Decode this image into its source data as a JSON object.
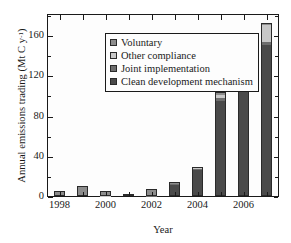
{
  "chart_data": {
    "type": "bar",
    "subtype": "stacked-bar",
    "title": "",
    "xlabel": "Year",
    "ylabel": "Annual emissions trading (Mt C y⁻¹)",
    "ylabel_parts": {
      "text": "Annual emissions trading (Mt C y",
      "sup": "-1",
      "tail": ")"
    },
    "ylim": [
      0,
      180
    ],
    "yticks": [
      0,
      40,
      80,
      120,
      160
    ],
    "ytick_labels": [
      "0",
      "40",
      "80",
      "120",
      "160"
    ],
    "yminor_ticks": [
      20,
      60,
      100,
      140,
      180
    ],
    "grid": false,
    "legend_position": "upper left",
    "categories": [
      "1998",
      "1999",
      "2000",
      "2001",
      "2002",
      "2003",
      "2004",
      "2005",
      "2006",
      "2007"
    ],
    "xtick_labels": [
      "1998",
      "2000",
      "2002",
      "2004",
      "2006"
    ],
    "xtick_label_categories": [
      "1998",
      "2000",
      "2002",
      "2004",
      "2006"
    ],
    "series": [
      {
        "name": "Clean development mechanism",
        "color": "#4a4a4a",
        "values": [
          0.0,
          0.0,
          0.0,
          0.0,
          0.0,
          10.5,
          25.5,
          94.0,
          148.0,
          150.0
        ]
      },
      {
        "name": "Joint implementation",
        "color": "#6e6e6e",
        "values": [
          0.0,
          0.0,
          0.0,
          0.0,
          0.5,
          1.0,
          1.5,
          3.0,
          4.0,
          3.0
        ]
      },
      {
        "name": "Other compliance",
        "color": "#c8c8c8",
        "values": [
          0.0,
          0.0,
          0.5,
          0.0,
          0.5,
          0.5,
          0.5,
          3.0,
          5.0,
          17.0
        ]
      },
      {
        "name": "Voluntary",
        "color": "#8c8c8c",
        "values": [
          4.5,
          9.5,
          4.0,
          2.5,
          5.5,
          2.0,
          1.5,
          3.0,
          3.0,
          2.0
        ]
      }
    ],
    "totals": [
      4.5,
      9.5,
      4.5,
      2.5,
      6.5,
      14.0,
      29.0,
      103.0,
      160.0,
      172.0
    ],
    "legend_entries": [
      {
        "label": "Voluntary",
        "color": "#8c8c8c"
      },
      {
        "label": "Other compliance",
        "color": "#c8c8c8"
      },
      {
        "label": "Joint implementation",
        "color": "#6e6e6e"
      },
      {
        "label": "Clean development mechanism",
        "color": "#4a4a4a"
      }
    ]
  }
}
